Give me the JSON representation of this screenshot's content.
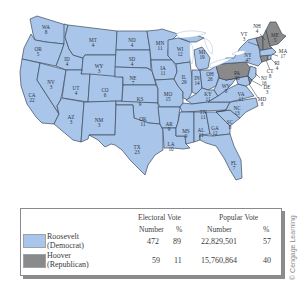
{
  "map": {
    "colors": {
      "democrat": "#a9c5ea",
      "republican": "#8a8a8a",
      "border": "#3b4a5c"
    },
    "states": [
      {
        "abbr": "WA",
        "votes": "8",
        "winner": "Roosevelt"
      },
      {
        "abbr": "OR",
        "votes": "5",
        "winner": "Roosevelt"
      },
      {
        "abbr": "CA",
        "votes": "22",
        "winner": "Roosevelt"
      },
      {
        "abbr": "ID",
        "votes": "4",
        "winner": "Roosevelt"
      },
      {
        "abbr": "NV",
        "votes": "3",
        "winner": "Roosevelt"
      },
      {
        "abbr": "MT",
        "votes": "4",
        "winner": "Roosevelt"
      },
      {
        "abbr": "WY",
        "votes": "3",
        "winner": "Roosevelt"
      },
      {
        "abbr": "UT",
        "votes": "4",
        "winner": "Roosevelt"
      },
      {
        "abbr": "AZ",
        "votes": "3",
        "winner": "Roosevelt"
      },
      {
        "abbr": "CO",
        "votes": "6",
        "winner": "Roosevelt"
      },
      {
        "abbr": "NM",
        "votes": "3",
        "winner": "Roosevelt"
      },
      {
        "abbr": "ND",
        "votes": "4",
        "winner": "Roosevelt"
      },
      {
        "abbr": "SD",
        "votes": "4",
        "winner": "Roosevelt"
      },
      {
        "abbr": "NE",
        "votes": "7",
        "winner": "Roosevelt"
      },
      {
        "abbr": "KS",
        "votes": "9",
        "winner": "Roosevelt"
      },
      {
        "abbr": "OK",
        "votes": "11",
        "winner": "Roosevelt"
      },
      {
        "abbr": "TX",
        "votes": "23",
        "winner": "Roosevelt"
      },
      {
        "abbr": "MN",
        "votes": "11",
        "winner": "Roosevelt"
      },
      {
        "abbr": "IA",
        "votes": "11",
        "winner": "Roosevelt"
      },
      {
        "abbr": "MO",
        "votes": "15",
        "winner": "Roosevelt"
      },
      {
        "abbr": "AR",
        "votes": "9",
        "winner": "Roosevelt"
      },
      {
        "abbr": "LA",
        "votes": "10",
        "winner": "Roosevelt"
      },
      {
        "abbr": "WI",
        "votes": "12",
        "winner": "Roosevelt"
      },
      {
        "abbr": "IL",
        "votes": "29",
        "winner": "Roosevelt"
      },
      {
        "abbr": "MI",
        "votes": "19",
        "winner": "Roosevelt"
      },
      {
        "abbr": "IN",
        "votes": "14",
        "winner": "Roosevelt"
      },
      {
        "abbr": "OH",
        "votes": "26",
        "winner": "Roosevelt"
      },
      {
        "abbr": "KY",
        "votes": "11",
        "winner": "Roosevelt"
      },
      {
        "abbr": "TN",
        "votes": "11",
        "winner": "Roosevelt"
      },
      {
        "abbr": "MS",
        "votes": "9",
        "winner": "Roosevelt"
      },
      {
        "abbr": "AL",
        "votes": "11",
        "winner": "Roosevelt"
      },
      {
        "abbr": "GA",
        "votes": "12",
        "winner": "Roosevelt"
      },
      {
        "abbr": "FL",
        "votes": "7",
        "winner": "Roosevelt"
      },
      {
        "abbr": "SC",
        "votes": "8",
        "winner": "Roosevelt"
      },
      {
        "abbr": "NC",
        "votes": "13",
        "winner": "Roosevelt"
      },
      {
        "abbr": "VA",
        "votes": "11",
        "winner": "Roosevelt"
      },
      {
        "abbr": "WV",
        "votes": "8",
        "winner": "Roosevelt"
      },
      {
        "abbr": "MD",
        "votes": "8",
        "winner": "Roosevelt"
      },
      {
        "abbr": "NY",
        "votes": "47",
        "winner": "Roosevelt"
      },
      {
        "abbr": "NJ",
        "votes": "16",
        "winner": "Roosevelt"
      },
      {
        "abbr": "PA",
        "votes": "36",
        "winner": "Hoover"
      },
      {
        "abbr": "DE",
        "votes": "3",
        "winner": "Hoover"
      },
      {
        "abbr": "CT",
        "votes": "8",
        "winner": "Hoover"
      },
      {
        "abbr": "RI",
        "votes": "4",
        "winner": "Roosevelt"
      },
      {
        "abbr": "MA",
        "votes": "17",
        "winner": "Roosevelt"
      },
      {
        "abbr": "VT",
        "votes": "3",
        "winner": "Hoover"
      },
      {
        "abbr": "NH",
        "votes": "4",
        "winner": "Hoover"
      },
      {
        "abbr": "ME",
        "votes": "5",
        "winner": "Hoover"
      }
    ]
  },
  "legend": {
    "headers": {
      "electoral": "Electoral Vote",
      "popular": "Popular Vote",
      "number": "Number",
      "percent": "%"
    },
    "rows": [
      {
        "candidate": "Roosevelt",
        "party": "(Democrat)",
        "color": "#a9c5ea",
        "electoral_number": "472",
        "electoral_percent": "89",
        "popular_number": "22,829,501",
        "popular_percent": "57"
      },
      {
        "candidate": "Hoover",
        "party": "(Republican)",
        "color": "#8a8a8a",
        "electoral_number": "59",
        "electoral_percent": "11",
        "popular_number": "15,760,864",
        "popular_percent": "40"
      }
    ]
  },
  "credit": "© Cengage Learning"
}
